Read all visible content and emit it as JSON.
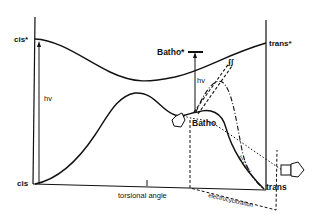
{
  "diagram": {
    "title": "",
    "labels": {
      "cis_excited": "cis*",
      "cis_ground": "cis",
      "trans_excited": "trans*",
      "trans_ground": "trans",
      "batho_excited": "Batho*",
      "batho_ground": "Batho",
      "hv_left": "hv",
      "hv_center": "hv",
      "x_axis": "torsional angle",
      "electrocyclization": "electrocyclization",
      "to_lumi": "to Lumi"
    },
    "colors": {
      "line": "#111111",
      "background": "#ffffff"
    },
    "elements": [
      "excited-state-surface",
      "ground-state-surface",
      "cis-vertical-axis",
      "trans-vertical-axis",
      "photoexcitation-arrow-cis",
      "photoexcitation-arrow-batho",
      "dashed-decay-paths",
      "dash-dot-decay-path",
      "dotted-decay-path",
      "electrocyclization-dashed-path",
      "chromophore-ring-icons"
    ]
  }
}
